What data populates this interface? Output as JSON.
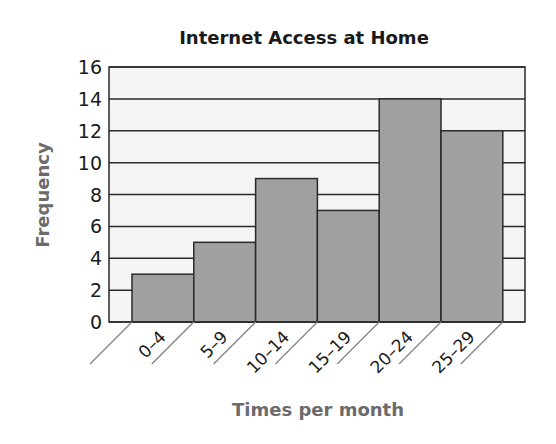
{
  "chart_data": {
    "type": "bar",
    "title": "Internet Access at Home",
    "xlabel": "Times per month",
    "ylabel": "Frequency",
    "categories": [
      "0–4",
      "5–9",
      "10–14",
      "15–19",
      "20–24",
      "25–29"
    ],
    "values": [
      3,
      5,
      9,
      7,
      14,
      12
    ],
    "ylim": [
      0,
      16
    ],
    "yticks": [
      0,
      2,
      4,
      6,
      8,
      10,
      12,
      14,
      16
    ],
    "grid": true,
    "histogram": true,
    "colors": {
      "bar": "#a0a0a0",
      "plot_bg": "#f5f5f5",
      "axis_title": "#6b6b6b",
      "line": "#2a2a2a"
    }
  },
  "title": "Internet Access at Home",
  "xlabel": "Times per month",
  "ylabel": "Frequency"
}
